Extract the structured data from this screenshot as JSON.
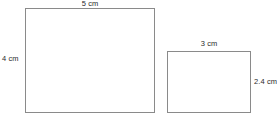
{
  "diagram": {
    "type": "geometry-figure",
    "background_color": "#ffffff",
    "stroke_color": "#8a8a8a",
    "label_color": "#2b2b2b",
    "shapes": [
      {
        "id": "rect-large",
        "name": "large-rectangle",
        "shape": "rectangle",
        "width_label": "5 cm",
        "height_label": "4 cm",
        "width_value": 5,
        "height_value": 4,
        "units": "cm",
        "width_label_position": "top",
        "height_label_position": "left",
        "fill": "#ffffff"
      },
      {
        "id": "rect-small",
        "name": "small-rectangle",
        "shape": "rectangle",
        "width_label": "3 cm",
        "height_label": "2.4 cm",
        "width_value": 3,
        "height_value": 2.4,
        "units": "cm",
        "width_label_position": "top",
        "height_label_position": "right",
        "fill": "#ffffff"
      }
    ]
  }
}
